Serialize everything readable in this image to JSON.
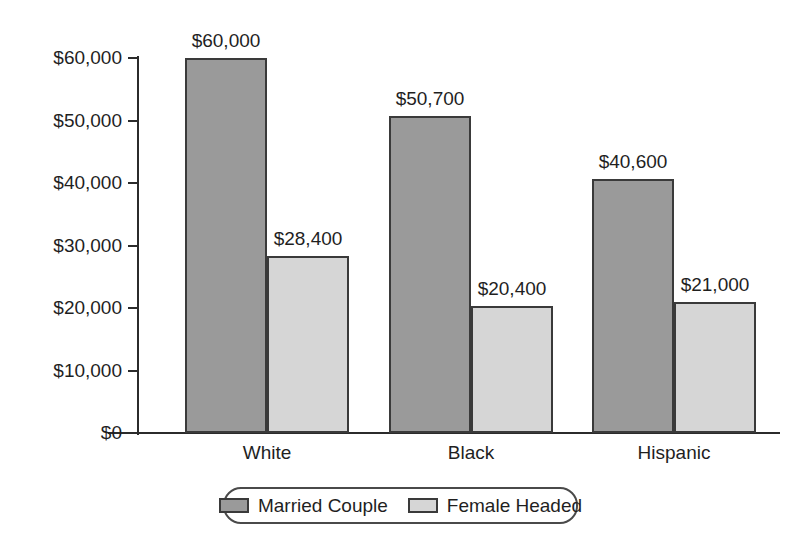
{
  "chart_data": {
    "type": "bar",
    "title": "",
    "subtitle": "",
    "xlabel": "",
    "ylabel": "",
    "categories": [
      "White",
      "Black",
      "Hispanic"
    ],
    "series": [
      {
        "name": "Married Couple",
        "color": "#9a9a9a",
        "values": [
          60000,
          50700,
          40600
        ],
        "value_labels": [
          "$60,000",
          "$50,700",
          "$40,600"
        ]
      },
      {
        "name": "Female Headed",
        "color": "#d6d6d6",
        "values": [
          28400,
          20400,
          21000
        ],
        "value_labels": [
          "$28,400",
          "$20,400",
          "$21,000"
        ]
      }
    ],
    "ylim": [
      0,
      60000
    ],
    "ytick_values": [
      60000,
      50000,
      40000,
      30000,
      20000,
      10000,
      0
    ],
    "ytick_labels": [
      "$60,000",
      "$50,000",
      "$40,000",
      "$30,000",
      "$20,000",
      "$10,000",
      "$0"
    ],
    "grid": false,
    "legend_position": "bottom",
    "legend_entries": [
      "Married Couple",
      "Female Headed"
    ],
    "axis_color": "#2b2b2b",
    "bar_border_color": "#3a3a3a",
    "background_color": "#ffffff"
  }
}
